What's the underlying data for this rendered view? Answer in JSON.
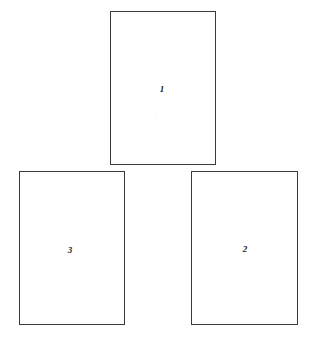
{
  "figure": {
    "background_color": "#ffffff",
    "stroke_color": "#3a3a3c",
    "label_color": "#232326",
    "canvas": {
      "width": 312,
      "height": 345
    },
    "boxes": [
      {
        "id": "box-1",
        "label": "1",
        "x": 110,
        "y": 11,
        "width": 106,
        "height": 154,
        "label_x": 162,
        "label_y": 89
      },
      {
        "id": "box-3",
        "label": "3",
        "x": 19,
        "y": 171,
        "width": 106,
        "height": 154,
        "label_x": 70,
        "label_y": 250
      },
      {
        "id": "box-2",
        "label": "2",
        "x": 191,
        "y": 171,
        "width": 107,
        "height": 154,
        "label_x": 245,
        "label_y": 249
      }
    ]
  }
}
